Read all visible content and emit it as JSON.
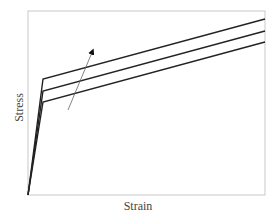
{
  "chart_data": {
    "type": "line",
    "title": "",
    "xlabel": "Strain",
    "ylabel": "Stress",
    "grid": false,
    "legend": null,
    "ticks": "none",
    "annotations": [
      {
        "type": "arrow",
        "description": "Arrow pointing upward across the curves (increasing parameter)",
        "from": [
          68,
          110
        ],
        "to": [
          93,
          50
        ]
      }
    ],
    "series": [
      {
        "name": "curve-1 (lowest)",
        "points_px": [
          [
            28,
            195
          ],
          [
            43,
            102
          ],
          [
            265,
            42
          ]
        ]
      },
      {
        "name": "curve-2 (middle)",
        "points_px": [
          [
            28,
            195
          ],
          [
            43,
            91
          ],
          [
            265,
            31
          ]
        ]
      },
      {
        "name": "curve-3 (highest)",
        "points_px": [
          [
            28,
            195
          ],
          [
            43,
            79
          ],
          [
            265,
            19
          ]
        ]
      }
    ],
    "plot_frame_px": {
      "left": 28,
      "top": 11,
      "right": 265,
      "bottom": 195
    }
  },
  "labels": {
    "x": "Strain",
    "y": "Stress"
  }
}
